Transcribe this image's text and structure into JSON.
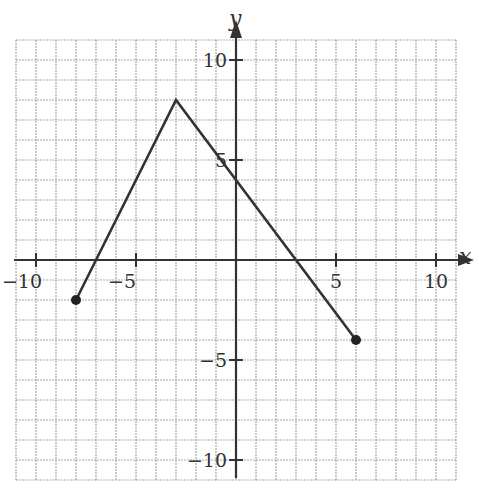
{
  "chart_data": {
    "type": "line",
    "title": "",
    "xlabel": "x",
    "ylabel": "y",
    "xlim": [
      -11,
      11
    ],
    "ylim": [
      -11,
      11
    ],
    "grid": true,
    "grid_step": 1,
    "x_ticks": [
      -10,
      -5,
      5,
      10
    ],
    "y_ticks": [
      -10,
      -5,
      5,
      10
    ],
    "x_tick_labels": [
      "−10",
      "−5",
      "5",
      "10"
    ],
    "y_tick_labels": [
      "−10",
      "−5",
      "5",
      "10"
    ],
    "series": [
      {
        "name": "piecewise linear graph",
        "points": [
          [
            -8,
            -2
          ],
          [
            -3,
            8
          ],
          [
            6,
            -4
          ]
        ],
        "endpoints": "closed"
      }
    ]
  }
}
